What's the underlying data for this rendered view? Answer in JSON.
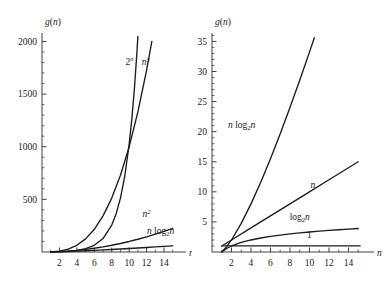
{
  "figure": {
    "background": "#ffffff",
    "ink": "#1a1a1a"
  },
  "chart_data": [
    {
      "type": "line",
      "panel": "left",
      "title": "",
      "xlabel": "n",
      "ylabel": "g(n)",
      "xlim": [
        0,
        15.6
      ],
      "ylim": [
        0,
        2080
      ],
      "grid": false,
      "legend": "inline-curve-labels",
      "x_ticks_major": [
        2,
        4,
        6,
        8,
        10,
        12,
        14
      ],
      "x_ticks_minor": [
        1,
        3,
        5,
        7,
        9,
        11,
        13,
        15
      ],
      "y_ticks_major": [
        500,
        1000,
        1500,
        2000
      ],
      "y_ticks_minor": [
        100,
        200,
        300,
        400,
        600,
        700,
        800,
        900,
        1100,
        1200,
        1300,
        1400,
        1600,
        1700,
        1800,
        1900
      ],
      "x_tick_labels": [
        "2",
        "4",
        "6",
        "8",
        "10",
        "12",
        "14"
      ],
      "y_tick_labels": [
        "500",
        "1000",
        "1500",
        "2000"
      ],
      "series": [
        {
          "name": "2^n",
          "label": "2n",
          "label_base": "2",
          "label_sup": "n",
          "label_pos": {
            "x": 10.05,
            "y": 1780
          },
          "x": [
            1,
            2,
            3,
            4,
            5,
            6,
            7,
            8,
            8.5,
            9,
            9.5,
            10,
            10.3,
            10.6,
            10.9,
            11.0
          ],
          "values": [
            2,
            4,
            8,
            16,
            32,
            64,
            128,
            256,
            362,
            512,
            724,
            1024,
            1260,
            1552,
            1910,
            2048
          ]
        },
        {
          "name": "n^3",
          "label": "n3",
          "label_base": "n",
          "label_sup": "3",
          "label_pos": {
            "x": 11.9,
            "y": 1775
          },
          "x": [
            1,
            2,
            3,
            4,
            5,
            6,
            7,
            8,
            9,
            10,
            11,
            12,
            12.6
          ],
          "values": [
            1,
            8,
            27,
            64,
            125,
            216,
            343,
            512,
            729,
            1000,
            1331,
            1728,
            2000
          ]
        },
        {
          "name": "n^2",
          "label": "n2",
          "label_base": "n",
          "label_sup": "2",
          "label_pos": {
            "x": 12.0,
            "y": 330
          },
          "x": [
            1,
            2,
            3,
            4,
            5,
            6,
            7,
            8,
            9,
            10,
            11,
            12,
            13,
            14,
            15
          ],
          "values": [
            1,
            4,
            9,
            16,
            25,
            36,
            49,
            64,
            81,
            100,
            121,
            144,
            169,
            196,
            225
          ]
        },
        {
          "name": "n log2 n",
          "label": "n log2n",
          "label_pos": {
            "x": 13.6,
            "y": 175
          },
          "x": [
            1,
            2,
            3,
            4,
            5,
            6,
            7,
            8,
            9,
            10,
            11,
            12,
            13,
            14,
            15
          ],
          "values": [
            0,
            2,
            4.75,
            8,
            11.6,
            15.5,
            19.65,
            24,
            28.53,
            33.22,
            38.05,
            43.02,
            48.11,
            53.3,
            58.6
          ]
        }
      ]
    },
    {
      "type": "line",
      "panel": "right",
      "title": "",
      "xlabel": "n",
      "ylabel": "g(n)",
      "xlim": [
        0,
        15.8
      ],
      "ylim": [
        0,
        36.4
      ],
      "grid": false,
      "legend": "inline-curve-labels",
      "x_ticks_major": [
        2,
        4,
        6,
        8,
        10,
        12,
        14
      ],
      "x_ticks_minor": [
        1,
        3,
        5,
        7,
        9,
        11,
        13,
        15
      ],
      "y_ticks_major": [
        5,
        10,
        15,
        20,
        25,
        30,
        35
      ],
      "y_ticks_minor": [
        1,
        2,
        3,
        4,
        6,
        7,
        8,
        9,
        11,
        12,
        13,
        14,
        16,
        17,
        18,
        19,
        21,
        22,
        23,
        24,
        26,
        27,
        28,
        29,
        31,
        32,
        33,
        34,
        36
      ],
      "x_tick_labels": [
        "2",
        "4",
        "6",
        "8",
        "10",
        "12",
        "14"
      ],
      "y_tick_labels": [
        "5",
        "10",
        "15",
        "20",
        "25",
        "30",
        "35"
      ],
      "series": [
        {
          "name": "n log2 n",
          "label": "n log2n",
          "label_pos": {
            "x": 3.05,
            "y": 20.6
          },
          "x": [
            1,
            1.5,
            2,
            3,
            4,
            5,
            6,
            7,
            8,
            9,
            10,
            10.5
          ],
          "values": [
            0,
            0.88,
            2,
            4.75,
            8,
            11.6,
            15.5,
            19.65,
            24,
            28.53,
            33.22,
            35.6
          ]
        },
        {
          "name": "n",
          "label": "n",
          "label_pos": {
            "x": 10.35,
            "y": 10.6
          },
          "x": [
            1,
            2,
            4,
            6,
            8,
            10,
            12,
            14,
            15
          ],
          "values": [
            1,
            2,
            4,
            6,
            8,
            10,
            12,
            14,
            15
          ]
        },
        {
          "name": "log2 n",
          "label": "log2n",
          "label_pos": {
            "x": 9.0,
            "y": 5.35
          },
          "x": [
            1,
            1.5,
            2,
            3,
            4,
            5,
            6,
            7,
            8,
            9,
            10,
            11,
            12,
            13,
            14,
            15
          ],
          "values": [
            0,
            0.585,
            1,
            1.585,
            2,
            2.322,
            2.585,
            2.807,
            3,
            3.17,
            3.322,
            3.46,
            3.585,
            3.7,
            3.807,
            3.907
          ]
        },
        {
          "name": "1",
          "label": "1",
          "label_pos": {
            "x": 10.0,
            "y": 2.3
          },
          "x": [
            1,
            15.2
          ],
          "values": [
            1,
            1
          ]
        }
      ]
    }
  ]
}
